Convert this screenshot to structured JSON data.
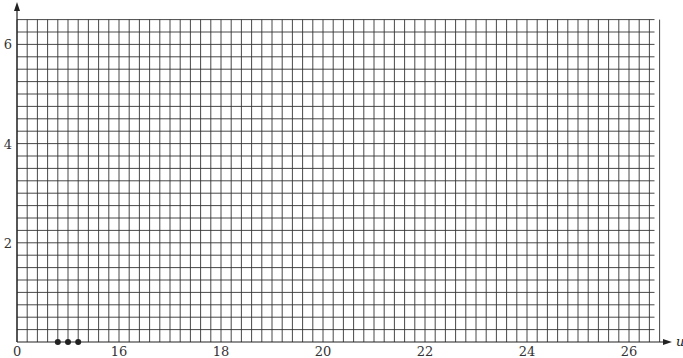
{
  "chart_data": {
    "type": "scatter",
    "title": "",
    "xlabel": "u",
    "ylabel": "",
    "x_axis_break": true,
    "x_origin_label": "0",
    "xlim": [
      14.0,
      26.5
    ],
    "ylim": [
      0,
      6.5
    ],
    "x_ticks": [
      16,
      18,
      20,
      22,
      24,
      26
    ],
    "x_tick_labels": [
      "16",
      "18",
      "20",
      "22",
      "24",
      "26"
    ],
    "y_ticks": [
      2,
      4,
      6
    ],
    "y_tick_labels": [
      "2",
      "4",
      "6"
    ],
    "grid": true,
    "grid_x_step": 0.2,
    "grid_y_step": 0.25,
    "legend": null,
    "series": [
      {
        "name": "points",
        "marker": "filled-circle",
        "color": "#222222",
        "x": [
          14.8,
          15.0,
          15.2
        ],
        "y": [
          0,
          0,
          0
        ]
      }
    ]
  },
  "colors": {
    "grid": "#333333",
    "axis": "#222222",
    "points": "#222222"
  }
}
